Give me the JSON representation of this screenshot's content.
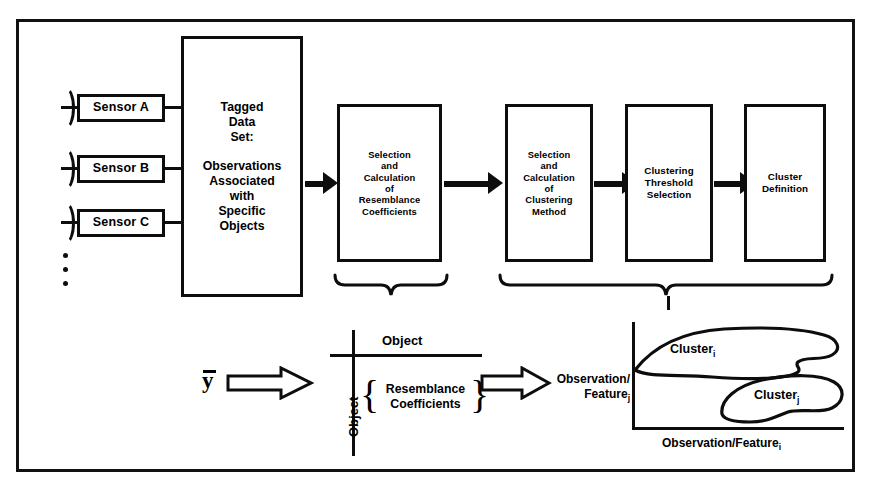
{
  "diagram": {
    "sensors": [
      {
        "label": "Sensor A",
        "icon": "antenna-icon"
      },
      {
        "label": "Sensor B",
        "icon": "antenna-icon"
      },
      {
        "label": "Sensor C",
        "icon": "antenna-icon"
      }
    ],
    "sensors_continuation": "vertical-ellipsis",
    "tagged_data_box": {
      "line1": "Tagged",
      "line2": "Data",
      "line3": "Set:",
      "line4": "Observations",
      "line5": "Associated",
      "line6": "with",
      "line7": "Specific",
      "line8": "Objects"
    },
    "process_boxes": [
      {
        "id": "resemblance",
        "lines": [
          "Selection",
          "and",
          "Calculation",
          "of",
          "Resemblance",
          "Coefficients"
        ]
      },
      {
        "id": "clustering-method",
        "lines": [
          "Selection",
          "and",
          "Calculation",
          "of",
          "Clustering",
          "Method"
        ]
      },
      {
        "id": "threshold",
        "lines": [
          "Clustering",
          "Threshold",
          "Selection"
        ]
      },
      {
        "id": "cluster-definition",
        "lines": [
          "Cluster",
          "Definition"
        ]
      }
    ],
    "lower": {
      "vector_symbol": "y",
      "vector_overbar": true,
      "matrix": {
        "top_label": "Object",
        "side_label": "Object",
        "content_line1": "Resemblance",
        "content_line2": "Coefficients",
        "open_brace": "{",
        "close_brace": "}"
      },
      "plot": {
        "ylabel_line1": "Observation/",
        "ylabel_line2": "Feature",
        "ylabel_sub": "j",
        "xlabel": "Observation/Feature",
        "xlabel_sub": "i",
        "clusters": [
          {
            "label": "Cluster",
            "sub": "i"
          },
          {
            "label": "Cluster",
            "sub": "j"
          }
        ]
      }
    },
    "colors": {
      "ink": "#0d0d0d",
      "background": "#ffffff"
    }
  }
}
